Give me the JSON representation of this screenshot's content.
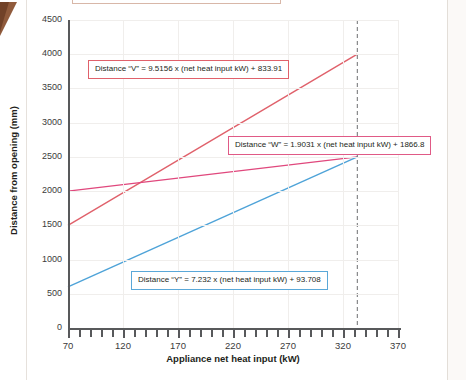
{
  "page": {
    "top_clipped_caption": "....pp... ..g. ... .... .....g..."
  },
  "chart_data": {
    "type": "line",
    "title": "",
    "xlabel": "Appliance net heat input (kW)",
    "ylabel": "Distance from opening (mm)",
    "xlim": [
      70,
      370
    ],
    "ylim": [
      0,
      4500
    ],
    "xticks": [
      70,
      120,
      170,
      220,
      270,
      320,
      370
    ],
    "xtick_labels": [
      "70",
      "120",
      "170",
      "220",
      "270",
      "320",
      "370"
    ],
    "x_minor_step": 10,
    "yticks": [
      0,
      500,
      1000,
      1500,
      2000,
      2500,
      3000,
      3500,
      4000,
      4500
    ],
    "ytick_labels": [
      "0",
      "500",
      "1000",
      "1500",
      "2000",
      "2500",
      "3000",
      "3500",
      "4000",
      "4500"
    ],
    "grid": true,
    "legend": "none",
    "x_domain_plotted": [
      70,
      333
    ],
    "marker_line": {
      "x": 333,
      "style": "dashed",
      "color": "#6d6e71"
    },
    "series": [
      {
        "name": "Distance V",
        "slope": 9.5156,
        "intercept": 833.91,
        "color": "#e0616b",
        "x": [
          70,
          333
        ],
        "values": [
          1499.0,
          4002.6
        ]
      },
      {
        "name": "Distance W",
        "slope": 1.9031,
        "intercept": 1866.8,
        "color": "#e0487d",
        "x": [
          70,
          333
        ],
        "values": [
          2000.0,
          2500.5
        ]
      },
      {
        "name": "Distance Y",
        "slope": 7.232,
        "intercept": 93.708,
        "color": "#4ea3d8",
        "x": [
          70,
          333
        ],
        "values": [
          600.0,
          2501.0
        ]
      }
    ],
    "annotations": [
      {
        "id": "v",
        "text": "Distance “V” = 9.5156 x (net heat input kW) + 833.91",
        "border_color": "#e0616b"
      },
      {
        "id": "w",
        "text": "Distance “W” = 1.9031 x (net heat input kW) + 1866.8",
        "border_color": "#e05a86"
      },
      {
        "id": "y",
        "text": "Distance “Y” = 7.232 x (net heat input kW) + 93.708",
        "border_color": "#5aa8d8"
      }
    ]
  }
}
